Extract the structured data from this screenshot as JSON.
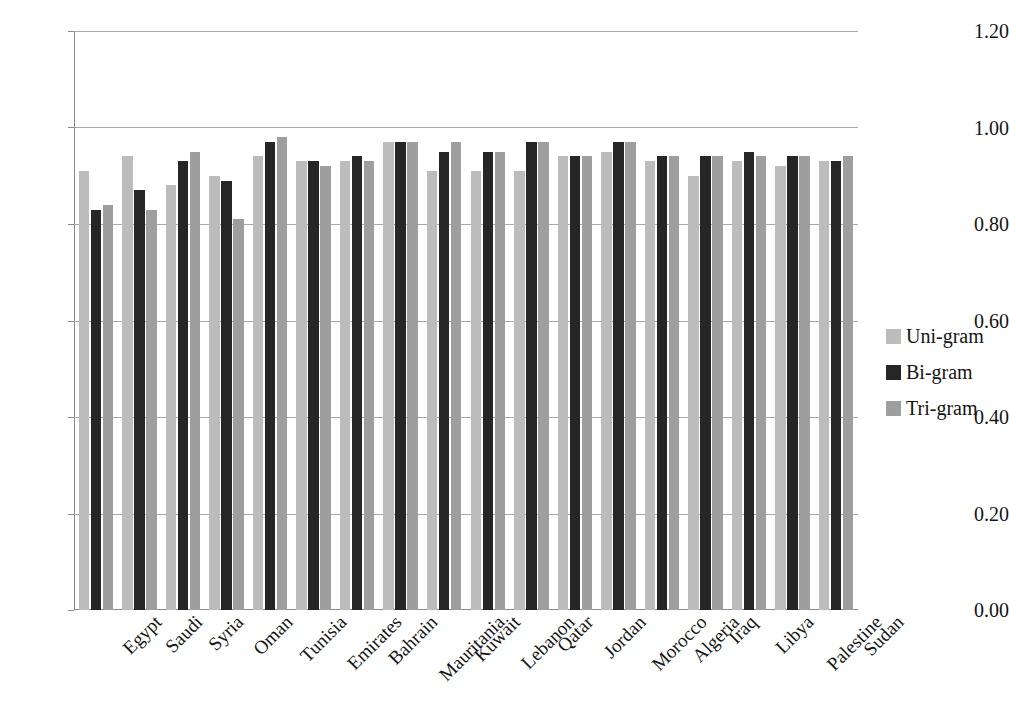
{
  "chart_data": {
    "type": "bar",
    "title": "",
    "xlabel": "",
    "ylabel": "",
    "ylim": [
      0.0,
      1.2
    ],
    "yticks": [
      "0.00",
      "0.20",
      "0.40",
      "0.60",
      "0.80",
      "1.00",
      "1.20"
    ],
    "ytick_values": [
      0.0,
      0.2,
      0.4,
      0.6,
      0.8,
      1.0,
      1.2
    ],
    "grid": "horizontal",
    "legend_position": "right",
    "categories": [
      "Egypt",
      "Saudi",
      "Syria",
      "Oman",
      "Tunisia",
      "Emirates",
      "Bahrain",
      "Mauritania",
      "Kuwait",
      "Lebanon",
      "Qatar",
      "Jordan",
      "Morocco",
      "Algeria",
      "Iraq",
      "Libya",
      "Palestine",
      "Sudan"
    ],
    "series": [
      {
        "name": "Uni-gram",
        "color": "#bcbcbc",
        "values": [
          0.91,
          0.94,
          0.88,
          0.9,
          0.94,
          0.93,
          0.93,
          0.97,
          0.91,
          0.91,
          0.91,
          0.94,
          0.95,
          0.93,
          0.9,
          0.93,
          0.92,
          0.93
        ]
      },
      {
        "name": "Bi-gram",
        "color": "#262626",
        "values": [
          0.83,
          0.87,
          0.93,
          0.89,
          0.97,
          0.93,
          0.94,
          0.97,
          0.95,
          0.95,
          0.97,
          0.94,
          0.97,
          0.94,
          0.94,
          0.95,
          0.94,
          0.93
        ]
      },
      {
        "name": "Tri-gram",
        "color": "#9e9e9e",
        "values": [
          0.84,
          0.83,
          0.95,
          0.81,
          0.98,
          0.92,
          0.93,
          0.97,
          0.97,
          0.95,
          0.97,
          0.94,
          0.97,
          0.94,
          0.94,
          0.94,
          0.94,
          0.94
        ]
      }
    ]
  },
  "legend": {
    "items": [
      {
        "label": "Uni-gram",
        "key": "uni"
      },
      {
        "label": "Bi-gram",
        "key": "bi"
      },
      {
        "label": "Tri-gram",
        "key": "tri"
      }
    ]
  }
}
